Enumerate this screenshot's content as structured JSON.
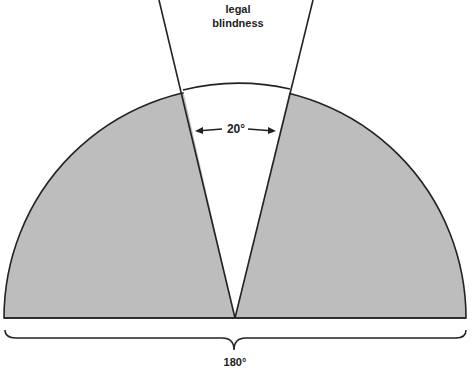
{
  "diagram": {
    "title_line1": "legal",
    "title_line2": "blindness",
    "angle_label": "20°",
    "span_label": "180°",
    "colors": {
      "field_fill": "#bdbdbd",
      "wedge_fill": "#ffffff",
      "stroke": "#222222"
    }
  }
}
